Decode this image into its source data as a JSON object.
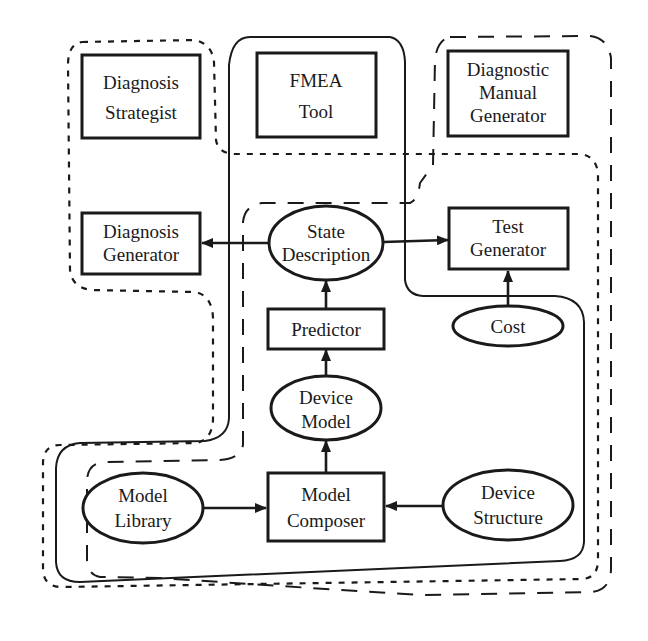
{
  "diagram": {
    "nodes": [
      {
        "id": "diagnosis_strategist",
        "shape": "rect",
        "lines": [
          "Diagnosis",
          "Strategist"
        ]
      },
      {
        "id": "fmea_tool",
        "shape": "rect",
        "lines": [
          "FMEA",
          "Tool"
        ]
      },
      {
        "id": "diagnostic_manual_generator",
        "shape": "rect",
        "lines": [
          "Diagnostic",
          "Manual",
          "Generator"
        ]
      },
      {
        "id": "diagnosis_generator",
        "shape": "rect",
        "lines": [
          "Diagnosis",
          "Generator"
        ]
      },
      {
        "id": "state_description",
        "shape": "ellipse",
        "lines": [
          "State",
          "Description"
        ]
      },
      {
        "id": "test_generator",
        "shape": "rect",
        "lines": [
          "Test",
          "Generator"
        ]
      },
      {
        "id": "predictor",
        "shape": "rect",
        "lines": [
          "Predictor"
        ]
      },
      {
        "id": "cost",
        "shape": "ellipse",
        "lines": [
          "Cost"
        ]
      },
      {
        "id": "device_model",
        "shape": "ellipse",
        "lines": [
          "Device",
          "Model"
        ]
      },
      {
        "id": "model_library",
        "shape": "ellipse",
        "lines": [
          "Model",
          "Library"
        ]
      },
      {
        "id": "model_composer",
        "shape": "rect",
        "lines": [
          "Model",
          "Composer"
        ]
      },
      {
        "id": "device_structure",
        "shape": "ellipse",
        "lines": [
          "Device",
          "Structure"
        ]
      }
    ],
    "edges": [
      {
        "from": "state_description",
        "to": "diagnosis_generator"
      },
      {
        "from": "state_description",
        "to": "test_generator"
      },
      {
        "from": "predictor",
        "to": "state_description"
      },
      {
        "from": "cost",
        "to": "test_generator"
      },
      {
        "from": "device_model",
        "to": "predictor"
      },
      {
        "from": "model_composer",
        "to": "device_model"
      },
      {
        "from": "model_library",
        "to": "model_composer"
      },
      {
        "from": "device_structure",
        "to": "model_composer"
      }
    ],
    "groupings": [
      {
        "style": "dotted",
        "encloses": [
          "diagnosis_strategist",
          "diagnosis_generator",
          "state_description",
          "test_generator",
          "predictor",
          "cost",
          "device_model",
          "model_library",
          "model_composer",
          "device_structure"
        ]
      },
      {
        "style": "solid",
        "encloses": [
          "fmea_tool",
          "state_description",
          "predictor",
          "device_model",
          "model_library",
          "model_composer",
          "device_structure"
        ]
      },
      {
        "style": "long-dashed",
        "encloses": [
          "diagnostic_manual_generator",
          "state_description",
          "predictor",
          "device_model",
          "model_library",
          "model_composer",
          "device_structure"
        ]
      }
    ]
  }
}
